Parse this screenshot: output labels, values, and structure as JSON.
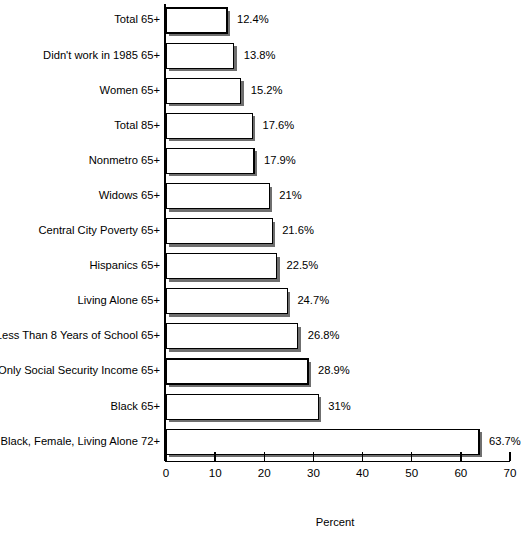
{
  "chart_data": {
    "type": "bar",
    "orientation": "horizontal",
    "title": "",
    "xlabel": "Percent",
    "ylabel": "",
    "xlim": [
      0,
      70
    ],
    "xticks": [
      0,
      10,
      20,
      30,
      40,
      50,
      60,
      70
    ],
    "xtick_labels": [
      "0",
      "10",
      "20",
      "30",
      "40",
      "50",
      "60",
      "70"
    ],
    "grid": false,
    "legend": null,
    "bar_style": "vertical-hatch-with-drop-shadow",
    "categories": [
      "Total 65+",
      "Didn't work in 1985 65+",
      "Women 65+",
      "Total 85+",
      "Nonmetro 65+",
      "Widows 65+",
      "Central City Poverty 65+",
      "Hispanics 65+",
      "Living Alone 65+",
      "Less Than 8 Years of School 65+",
      "Only Social Security Income 65+",
      "Black 65+",
      "Black, Female, Living Alone 72+"
    ],
    "values": [
      12.4,
      13.8,
      15.2,
      17.6,
      17.9,
      21,
      21.6,
      22.5,
      24.7,
      26.8,
      28.9,
      31,
      63.7
    ],
    "value_labels": [
      "12.4%",
      "13.8%",
      "15.2%",
      "17.6%",
      "17.9%",
      "21%",
      "21.6%",
      "22.5%",
      "24.7%",
      "26.8%",
      "28.9%",
      "31%",
      "63.7%"
    ]
  },
  "colors": {
    "bar_fill": "#ffffff",
    "bar_stroke": "#000000",
    "bar_shadow": "#6f6f6f",
    "background": "#ffffff",
    "text": "#000000"
  }
}
